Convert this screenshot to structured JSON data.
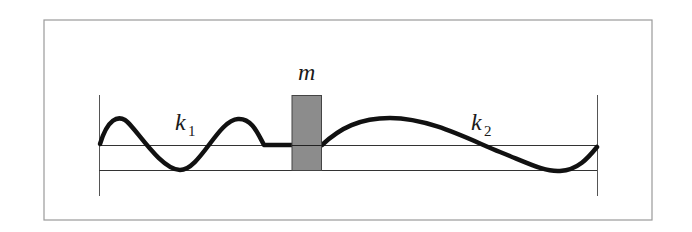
{
  "diagram": {
    "mass": {
      "symbol": "m",
      "fill": "#8c8c8c",
      "stroke": "#444444"
    },
    "spring_left": {
      "symbol": "k",
      "subscript": "1"
    },
    "spring_right": {
      "symbol": "k",
      "subscript": "2"
    },
    "colors": {
      "frame": "#9a9a9a",
      "walls": "#555555",
      "rails": "#333333",
      "spring": "#111111"
    }
  }
}
